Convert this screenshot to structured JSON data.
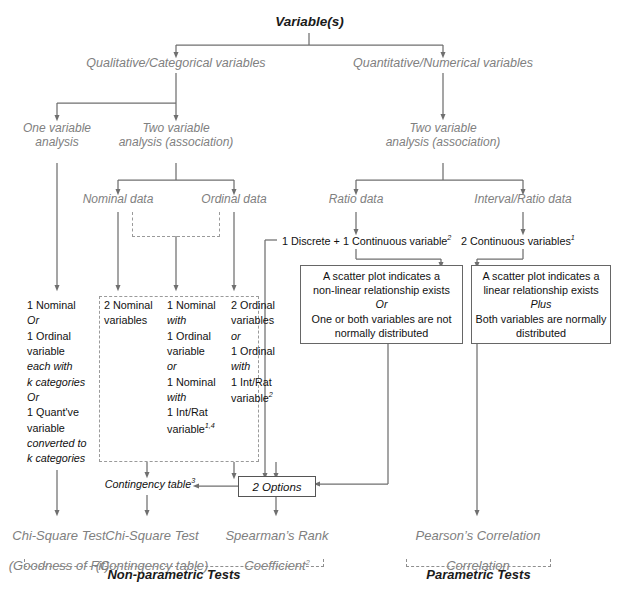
{
  "diagram": {
    "title": "Variable(s)",
    "root": "Variable(s)",
    "level1": {
      "left": "Qualitative/Categorical variables",
      "right": "Quantitative/Numerical variables"
    },
    "level2": {
      "one_var": "One variable\nanalysis",
      "two_var_cat": "Two variable\nanalysis (association)",
      "two_var_num": "Two variable\nanalysis (association)"
    },
    "level3": {
      "nominal": "Nominal data",
      "ordinal": "Ordinal data",
      "ratio": "Ratio data",
      "interval_ratio": "Interval/Ratio data"
    },
    "numeric_labels": {
      "discrete_continuous": "1 Discrete + 1 Continuous variable",
      "discrete_continuous_sup": "2",
      "two_continuous": "2 Continuous variables",
      "two_continuous_sup": "1"
    },
    "condition_boxes": [
      {
        "name": "non-linear-condition-box",
        "lines": [
          {
            "text": "A scatter plot indicates a",
            "italic": false
          },
          {
            "text": "non-linear relationship exists",
            "italic": false
          },
          {
            "text": "Or",
            "italic": true
          },
          {
            "text": "One or both variables are not",
            "italic": false
          },
          {
            "text": "normally distributed",
            "italic": false
          }
        ]
      },
      {
        "name": "linear-condition-box",
        "lines": [
          {
            "text": "A scatter plot indicates a",
            "italic": false
          },
          {
            "text": "linear relationship exists",
            "italic": false
          },
          {
            "text": "Plus",
            "italic": true
          },
          {
            "text": "Both variables are normally",
            "italic": false
          },
          {
            "text": "distributed",
            "italic": false
          }
        ]
      }
    ],
    "variable_columns": [
      {
        "name": "one-variable-column",
        "lines": [
          {
            "text": "1 Nominal",
            "italic": false,
            "sup": ""
          },
          {
            "text": "Or",
            "italic": true,
            "sup": ""
          },
          {
            "text": "1 Ordinal",
            "italic": false,
            "sup": ""
          },
          {
            "text": "variable",
            "italic": false,
            "sup": ""
          },
          {
            "text": "each with",
            "italic": true,
            "sup": ""
          },
          {
            "text": "k categories",
            "italic": true,
            "sup": ""
          },
          {
            "text": "Or",
            "italic": true,
            "sup": ""
          },
          {
            "text": "1 Quant've",
            "italic": false,
            "sup": ""
          },
          {
            "text": "variable",
            "italic": false,
            "sup": ""
          },
          {
            "text": "converted to",
            "italic": true,
            "sup": ""
          },
          {
            "text": "k categories",
            "italic": true,
            "sup": ""
          }
        ]
      },
      {
        "name": "two-nominal-column",
        "lines": [
          {
            "text": "2 Nominal",
            "italic": false,
            "sup": ""
          },
          {
            "text": "variables",
            "italic": false,
            "sup": ""
          }
        ]
      },
      {
        "name": "nominal-mixed-column",
        "lines": [
          {
            "text": "1 Nominal",
            "italic": false,
            "sup": ""
          },
          {
            "text": "with",
            "italic": true,
            "sup": ""
          },
          {
            "text": "1 Ordinal",
            "italic": false,
            "sup": ""
          },
          {
            "text": "variable",
            "italic": false,
            "sup": ""
          },
          {
            "text": "or",
            "italic": true,
            "sup": ""
          },
          {
            "text": "1 Nominal",
            "italic": false,
            "sup": ""
          },
          {
            "text": "with",
            "italic": true,
            "sup": ""
          },
          {
            "text": "1 Int/Rat",
            "italic": false,
            "sup": ""
          },
          {
            "text": "variable",
            "italic": false,
            "sup": "1,4"
          }
        ]
      },
      {
        "name": "ordinal-column",
        "lines": [
          {
            "text": "2 Ordinal",
            "italic": false,
            "sup": ""
          },
          {
            "text": "variables",
            "italic": false,
            "sup": ""
          },
          {
            "text": "or",
            "italic": true,
            "sup": ""
          },
          {
            "text": "1 Ordinal",
            "italic": false,
            "sup": ""
          },
          {
            "text": "with",
            "italic": true,
            "sup": ""
          },
          {
            "text": "1 Int/Rat",
            "italic": false,
            "sup": ""
          },
          {
            "text": "variable",
            "italic": false,
            "sup": "2"
          }
        ]
      }
    ],
    "contingency": {
      "label": "Contingency table",
      "sup": "3"
    },
    "options_box": {
      "label": "2 Options"
    },
    "tests": [
      {
        "name": "chi-square-goodness-of-fit",
        "line1": "Chi-Square Test",
        "line2": "(Goodness of Fit)",
        "sup": ""
      },
      {
        "name": "chi-square-contingency",
        "line1": "Chi-Square Test",
        "line2": "(Contingency table)",
        "sup": ""
      },
      {
        "name": "spearmans-rank",
        "line1": "Spearman’s Rank",
        "line2": "Coefficient",
        "sup": "2"
      },
      {
        "name": "pearsons-correlation",
        "line1": "Pearson’s Correlation",
        "line2": "Correlation",
        "sup": ""
      }
    ],
    "groups": {
      "non_parametric": "Non-parametric Tests",
      "parametric": "Parametric Tests"
    },
    "colors": {
      "text_gray": "#808080",
      "text_dark": "#1a1a1a",
      "line": "#6f6f6f",
      "box_border": "#666666",
      "dashed": "#9a9a9a",
      "background": "#ffffff"
    }
  }
}
